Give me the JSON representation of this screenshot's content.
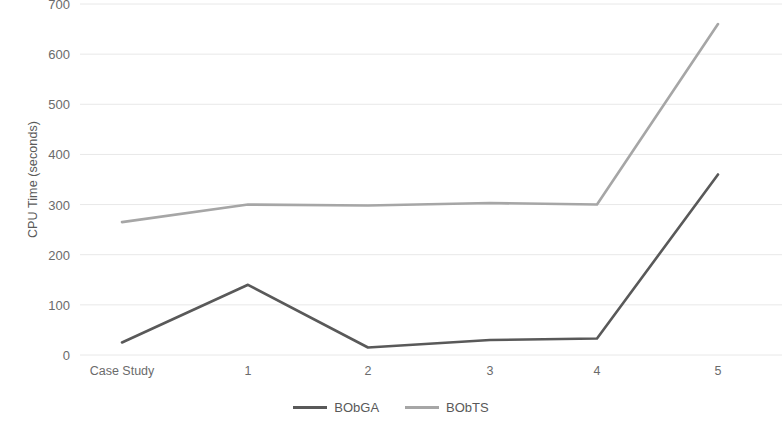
{
  "chart_data": {
    "type": "line",
    "title": "",
    "xlabel": "",
    "ylabel": "CPU Time (seconds)",
    "categories": [
      "Case Study",
      "1",
      "2",
      "3",
      "4",
      "5"
    ],
    "series": [
      {
        "name": "BObGA",
        "color": "#595959",
        "values": [
          25,
          140,
          15,
          30,
          33,
          360
        ]
      },
      {
        "name": "BObTS",
        "color": "#a6a6a6",
        "values": [
          265,
          300,
          298,
          303,
          300,
          660
        ]
      }
    ],
    "ylim": [
      0,
      700
    ],
    "ytick_labels": [
      "0",
      "100",
      "200",
      "300",
      "400",
      "500",
      "600",
      "700"
    ],
    "ytick_values": [
      0,
      100,
      200,
      300,
      400,
      500,
      600,
      700
    ],
    "grid": true,
    "grid_color": "#e8e8e8",
    "legend_position": "bottom",
    "background": "#ffffff"
  }
}
